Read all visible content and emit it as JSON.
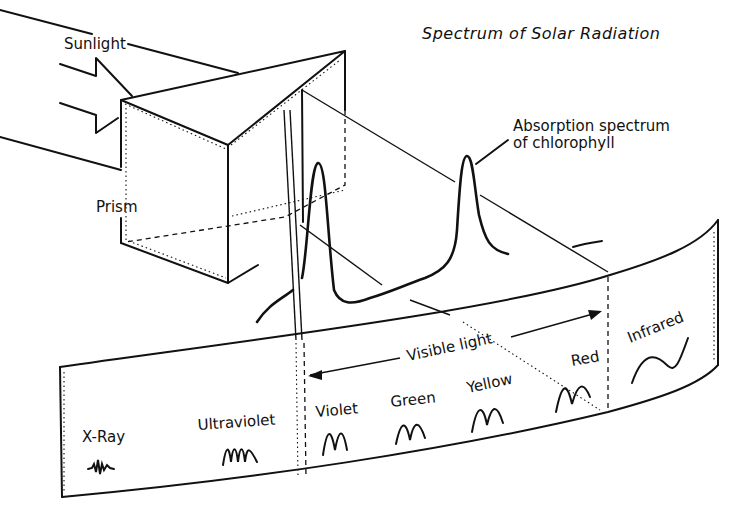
{
  "title": "Spectrum of Solar Radiation",
  "labels": {
    "sunlight": "Sunlight",
    "prism": "Prism",
    "absorption_line1": "Absorption spectrum",
    "absorption_line2": "of chlorophyll",
    "visible_light": "Visible light"
  },
  "bands": [
    {
      "name": "X-Ray"
    },
    {
      "name": "Ultraviolet"
    },
    {
      "name": "Violet"
    },
    {
      "name": "Green"
    },
    {
      "name": "Yellow"
    },
    {
      "name": "Red"
    },
    {
      "name": "Infrared"
    }
  ],
  "colors": {
    "ink": "#111111",
    "background": "#ffffff"
  }
}
